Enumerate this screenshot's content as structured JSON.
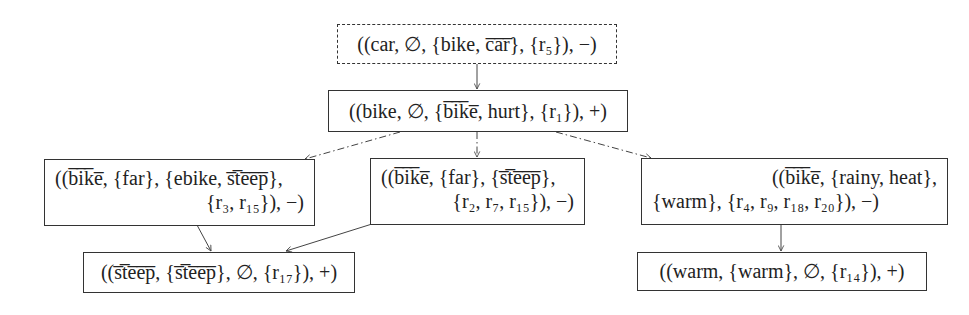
{
  "diagram": {
    "nodes": [
      {
        "id": "n0",
        "style": "dashed",
        "lines": [
          "((car, ∅, {bike, c̅a̅r̅}, {r₅}), −)"
        ]
      },
      {
        "id": "n1",
        "style": "solid",
        "lines": [
          "((bike, ∅, {b̅i̅k̅e̅, hurt}, {r₁}), +)"
        ]
      },
      {
        "id": "n2",
        "style": "solid",
        "lines": [
          "((b̅i̅k̅e̅, {far}, {ebike, s̅t̅e̅e̅p̅},",
          "{r₃, r₁₅}), −)"
        ]
      },
      {
        "id": "n3",
        "style": "solid",
        "lines": [
          "((b̅i̅k̅e̅, {far}, {s̅t̅e̅e̅p̅},",
          "{r₂, r₇, r₁₅}), −)"
        ]
      },
      {
        "id": "n4",
        "style": "solid",
        "lines": [
          "((b̅i̅k̅e̅, {rainy, heat},",
          "{warm}, {r₄, r₉, r₁₈, r₂₀}), −)"
        ]
      },
      {
        "id": "n5",
        "style": "solid",
        "lines": [
          "((s̅t̅e̅e̅p̅, {s̅t̅e̅e̅p̅}, ∅, {r₁₇}), +)"
        ]
      },
      {
        "id": "n6",
        "style": "solid",
        "lines": [
          "((warm, {warm}, ∅, {r₁₄}), +)"
        ]
      }
    ],
    "edges": [
      {
        "from": "n0",
        "to": "n1",
        "style": "solid"
      },
      {
        "from": "n1",
        "to": "n2",
        "style": "dashdot"
      },
      {
        "from": "n1",
        "to": "n3",
        "style": "dashdot"
      },
      {
        "from": "n1",
        "to": "n4",
        "style": "dashdot"
      },
      {
        "from": "n2",
        "to": "n5",
        "style": "solid"
      },
      {
        "from": "n3",
        "to": "n5",
        "style": "solid"
      },
      {
        "from": "n4",
        "to": "n6",
        "style": "solid"
      }
    ]
  }
}
